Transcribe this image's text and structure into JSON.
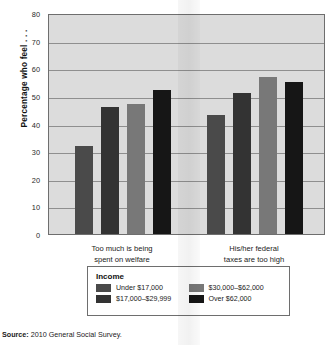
{
  "chart_data": {
    "type": "bar",
    "title": "",
    "xlabel": "",
    "ylabel": "Percentage who feel . . .",
    "ylim": [
      0,
      80
    ],
    "yticks": [
      0,
      10,
      20,
      30,
      40,
      50,
      60,
      70,
      80
    ],
    "grid": true,
    "legend_position": "bottom",
    "legend_title": "Income",
    "categories": [
      "Too much is being spent on welfare",
      "His/her federal taxes are too high"
    ],
    "category_lines": [
      [
        "Too much is being",
        "spent on welfare"
      ],
      [
        "His/her federal",
        "taxes are too high"
      ]
    ],
    "series": [
      {
        "name": "Under $17,000",
        "color": "#4a4a4a",
        "values": [
          32,
          43
        ]
      },
      {
        "name": "$17,000–$29,999",
        "color": "#333333",
        "values": [
          46,
          51
        ]
      },
      {
        "name": "$30,000–$62,000",
        "color": "#787878",
        "values": [
          47,
          57
        ]
      },
      {
        "name": "Over $62,000",
        "color": "#161616",
        "values": [
          52,
          55
        ]
      }
    ]
  },
  "source": {
    "label": "Source:",
    "text": "2010 General Social Survey."
  },
  "colors": {
    "plot_background": "#dcdcdc",
    "axis": "#6e6e6e",
    "gridline": "#8f8f8f",
    "page_background": "#ffffff"
  }
}
